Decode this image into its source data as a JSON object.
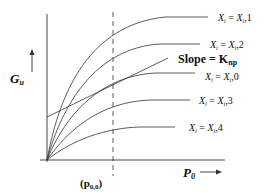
{
  "diagram": {
    "y_axis_label": {
      "main": "G",
      "sub": "u"
    },
    "x_axis_label": {
      "main": "P",
      "sub": "0"
    },
    "marker_label": {
      "main": "(p",
      "sub": "0,0",
      "close": ")"
    },
    "slope_label": {
      "main": "Slope = K",
      "sub": "np"
    },
    "curves": [
      {
        "id": "1",
        "label_lhs": "X",
        "label_lhs_sub": "i",
        "label_eq": " = ",
        "label_rhs": "X",
        "label_rhs_sub": "i",
        "label_idx": ",1"
      },
      {
        "id": "2",
        "label_lhs": "X",
        "label_lhs_sub": "i",
        "label_eq": " = ",
        "label_rhs": "X",
        "label_rhs_sub": "i",
        "label_idx": ",2"
      },
      {
        "id": "0",
        "label_lhs": "X",
        "label_lhs_sub": "i",
        "label_eq": " = ",
        "label_rhs": "X",
        "label_rhs_sub": "i",
        "label_idx": ",0"
      },
      {
        "id": "3",
        "label_lhs": "X",
        "label_lhs_sub": "i",
        "label_eq": " = ",
        "label_rhs": "X",
        "label_rhs_sub": "i",
        "label_idx": ",3"
      },
      {
        "id": "4",
        "label_lhs": "X",
        "label_lhs_sub": "i",
        "label_eq": " = ",
        "label_rhs": "X",
        "label_rhs_sub": "i",
        "label_idx": ",4"
      }
    ],
    "colors": {
      "line": "#333333",
      "text": "#111111",
      "background": "#ffffff"
    }
  }
}
